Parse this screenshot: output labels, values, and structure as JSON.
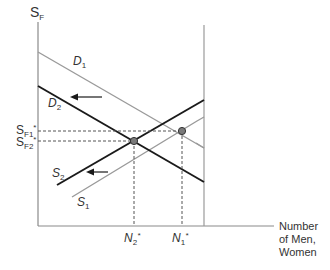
{
  "diagram": {
    "type": "supply-demand",
    "y_axis_label": {
      "main": "S",
      "sub": "F"
    },
    "x_axis_label": [
      "Number",
      "of Men,",
      "Women"
    ],
    "curves": [
      {
        "id": "D1",
        "label_main": "D",
        "label_sub": "1",
        "style": "gray",
        "color": "#9a9a9a"
      },
      {
        "id": "D2",
        "label_main": "D",
        "label_sub": "2",
        "style": "black",
        "color": "#1a1a1a"
      },
      {
        "id": "S1",
        "label_main": "S",
        "label_sub": "1",
        "style": "gray",
        "color": "#9a9a9a"
      },
      {
        "id": "S2",
        "label_main": "S",
        "label_sub": "2",
        "style": "black",
        "color": "#1a1a1a"
      }
    ],
    "y_ticks": [
      {
        "main": "S",
        "sub": "F1",
        "star": "*"
      },
      {
        "main": "S",
        "sub": "F2",
        "star": "*"
      }
    ],
    "x_ticks": [
      {
        "main": "N",
        "sub": "2",
        "star": "*"
      },
      {
        "main": "N",
        "sub": "1",
        "star": "*"
      }
    ],
    "shifts": [
      {
        "curve": "D",
        "direction": "left"
      },
      {
        "curve": "S",
        "direction": "left"
      }
    ],
    "equilibria": [
      {
        "id": "E1",
        "x_label": "N1*",
        "y_label": "SF1*"
      },
      {
        "id": "E2",
        "x_label": "N2*",
        "y_label": "SF2*"
      }
    ],
    "colors": {
      "gray_line": "#9a9a9a",
      "black_line": "#1a1a1a",
      "axis": "#8a8a8a",
      "point_fill": "#7a7a7a"
    }
  }
}
